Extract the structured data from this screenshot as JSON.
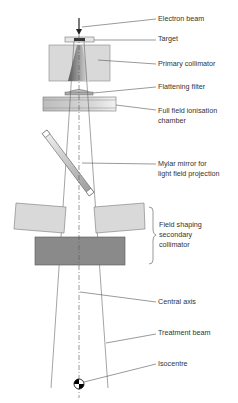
{
  "diagram": {
    "type": "linear accelerator treatment head schematic",
    "labels": {
      "electron_beam": "Electron beam",
      "target": "Target",
      "primary_collimator": "Primary collimator",
      "flattening_filter": "Flattening filter",
      "ion_chamber_line1": "Full field ionisation",
      "ion_chamber_line2": "chamber",
      "mylar_line1": "Mylar mirror for",
      "mylar_line2": "light field projection",
      "secondary_line1": "Field shaping",
      "secondary_line2": "secondary",
      "secondary_line3": "collimator",
      "central_axis": "Central axis",
      "treatment_beam": "Treatment beam",
      "isocentre": "Isocentre"
    },
    "colors": {
      "light_fill": "#d9d9d9",
      "mid_fill": "#bdbdbd",
      "dark_fill": "#8a8a8a",
      "line": "#555555"
    }
  }
}
